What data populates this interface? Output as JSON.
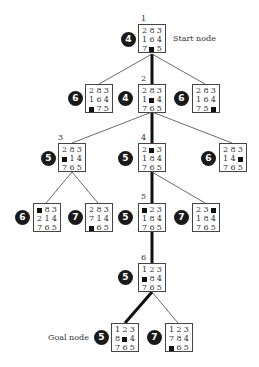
{
  "labels": {
    "start": "Start node",
    "goal": "Goal node"
  },
  "colors": {
    "score_bg": "#1a1a1a",
    "edge": "#333333",
    "path_edge": "#111111"
  },
  "nodes": [
    {
      "id": "root",
      "index": "1",
      "score": "4",
      "tiles": [
        "2",
        "8",
        "3",
        "1",
        "6",
        "4",
        "7",
        "",
        "5"
      ]
    },
    {
      "id": "l1-left",
      "index": "",
      "score": "6",
      "tiles": [
        "2",
        "8",
        "3",
        "1",
        "6",
        "4",
        "",
        "7",
        "5"
      ]
    },
    {
      "id": "l1-mid",
      "index": "2",
      "score": "4",
      "tiles": [
        "2",
        "8",
        "3",
        "1",
        "",
        "4",
        "7",
        "6",
        "5"
      ]
    },
    {
      "id": "l1-right",
      "index": "",
      "score": "6",
      "tiles": [
        "2",
        "8",
        "3",
        "1",
        "6",
        "4",
        "7",
        "5",
        ""
      ]
    },
    {
      "id": "l2-left",
      "index": "3",
      "score": "5",
      "tiles": [
        "2",
        "8",
        "3",
        "",
        "1",
        "4",
        "7",
        "6",
        "5"
      ]
    },
    {
      "id": "l2-mid",
      "index": "4",
      "score": "5",
      "tiles": [
        "2",
        "",
        "3",
        "1",
        "8",
        "4",
        "7",
        "6",
        "5"
      ]
    },
    {
      "id": "l2-right",
      "index": "",
      "score": "6",
      "tiles": [
        "2",
        "8",
        "3",
        "1",
        "4",
        "",
        "7",
        "6",
        "5"
      ]
    },
    {
      "id": "l3-a",
      "index": "",
      "score": "6",
      "tiles": [
        "",
        "8",
        "3",
        "2",
        "1",
        "4",
        "7",
        "6",
        "5"
      ]
    },
    {
      "id": "l3-b",
      "index": "",
      "score": "7",
      "tiles": [
        "2",
        "8",
        "3",
        "7",
        "1",
        "4",
        "",
        "6",
        "5"
      ]
    },
    {
      "id": "l3-c",
      "index": "5",
      "score": "5",
      "tiles": [
        "",
        "2",
        "3",
        "1",
        "8",
        "4",
        "7",
        "6",
        "5"
      ]
    },
    {
      "id": "l3-d",
      "index": "",
      "score": "7",
      "tiles": [
        "2",
        "3",
        "",
        "1",
        "8",
        "4",
        "7",
        "6",
        "5"
      ]
    },
    {
      "id": "l4",
      "index": "6",
      "score": "5",
      "tiles": [
        "1",
        "2",
        "3",
        "",
        "8",
        "4",
        "7",
        "6",
        "5"
      ]
    },
    {
      "id": "goal",
      "index": "",
      "score": "5",
      "tiles": [
        "1",
        "2",
        "3",
        "8",
        "",
        "4",
        "7",
        "6",
        "5"
      ]
    },
    {
      "id": "l5-right",
      "index": "",
      "score": "7",
      "tiles": [
        "1",
        "2",
        "3",
        "7",
        "8",
        "4",
        "",
        "6",
        "5"
      ]
    }
  ]
}
